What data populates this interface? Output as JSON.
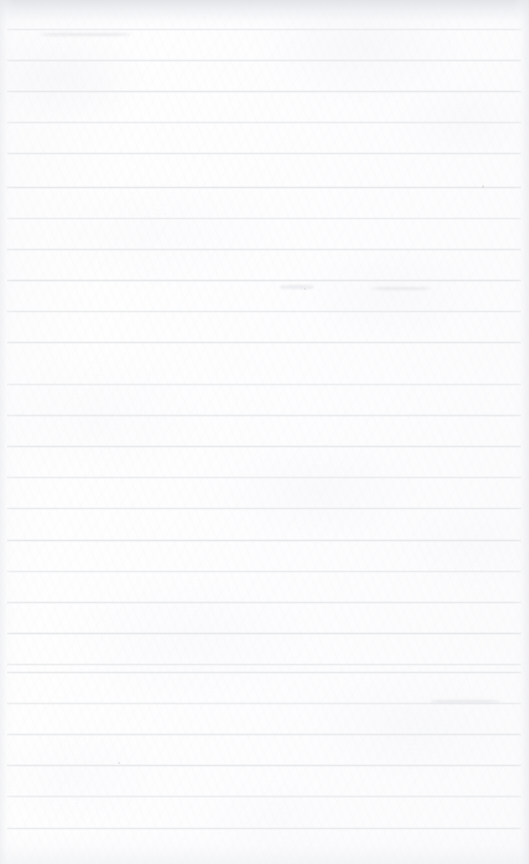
{
  "document": {
    "kind": "scanned-ruled-notebook-page",
    "title": "Blank ruled notebook page",
    "content_text": "",
    "handwriting_present": "no",
    "printed_text_present": "no"
  },
  "page": {
    "width": 529,
    "height": 864,
    "paper_color": "#fdfdfd",
    "paper_tint": "#fbfbfc",
    "orientation": "portrait"
  },
  "ruling": {
    "line_color": "#e7e8ea",
    "line_thickness": 1,
    "spacing": 31,
    "first_line_y": 29,
    "last_line_y": 828,
    "line_start_x": 7,
    "line_end_x": 521,
    "count": 27,
    "margin_rule": "none",
    "line_y_positions": [
      29,
      60,
      91,
      122,
      153,
      187,
      218,
      249,
      280,
      311,
      342,
      384,
      415,
      446,
      477,
      508,
      540,
      571,
      602,
      633,
      664,
      672,
      703,
      734,
      765,
      796,
      828
    ]
  },
  "scan_artifacts": {
    "top_shadow_color": "#dee0e4",
    "edge_shadow_color": "#eaecef",
    "specks": [
      {
        "x": 482,
        "y": 185,
        "w": 2,
        "h": 3
      },
      {
        "x": 304,
        "y": 288,
        "w": 2,
        "h": 2
      },
      {
        "x": 118,
        "y": 762,
        "w": 2,
        "h": 2
      }
    ],
    "smudges": [
      {
        "x": 280,
        "y": 285,
        "w": 34,
        "h": 4
      },
      {
        "x": 372,
        "y": 287,
        "w": 58,
        "h": 3
      },
      {
        "x": 40,
        "y": 33,
        "w": 90,
        "h": 3
      },
      {
        "x": 430,
        "y": 700,
        "w": 70,
        "h": 3
      }
    ]
  }
}
